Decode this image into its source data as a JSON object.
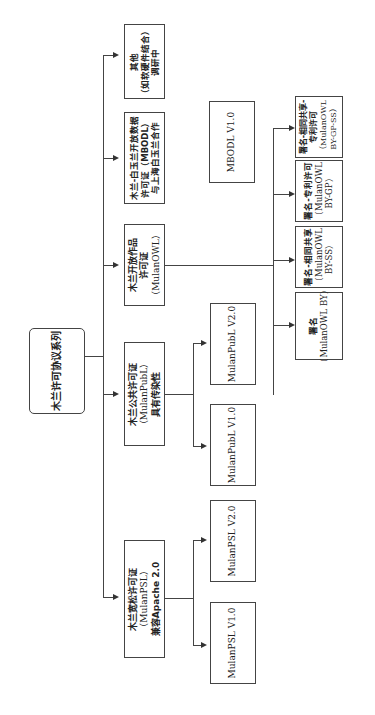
{
  "root": {
    "lines": [
      "木兰许可协议系列"
    ]
  },
  "level1": [
    {
      "id": "psl",
      "lines": [
        "木兰宽松许可证",
        "（MulanPSL）",
        "兼容Apache 2.0"
      ]
    },
    {
      "id": "publ",
      "lines": [
        "木兰公共许可证",
        "（MulanPubL）",
        "具有传染性"
      ]
    },
    {
      "id": "owl",
      "lines": [
        "木兰开放作品",
        "许可证",
        "（MulanOWL）"
      ]
    },
    {
      "id": "mbodl",
      "lines": [
        "木兰-白玉兰开放数据",
        "许可证（MBODL）",
        "与上海白玉兰合作"
      ]
    },
    {
      "id": "other",
      "lines": [
        "其他",
        "（如软硬件结合）",
        "调研中"
      ]
    }
  ],
  "leaves": {
    "psl": [
      {
        "lines": [
          "MulanPSL V1.0"
        ]
      },
      {
        "lines": [
          "MulanPSL V2.0"
        ]
      }
    ],
    "publ": [
      {
        "lines": [
          "MulanPubL V1.0"
        ]
      },
      {
        "lines": [
          "MulanPubL V2.0"
        ]
      }
    ],
    "mbodl": [
      {
        "lines": [
          "MBODL V1.0"
        ]
      }
    ],
    "owl": [
      {
        "lines": [
          "署名",
          "（MulanOWL BY）"
        ]
      },
      {
        "lines": [
          "署名-相同共享",
          "（MulanOWL",
          "BY-SS）"
        ]
      },
      {
        "lines": [
          "署名-专利许可",
          "（MulanOWL",
          "BY-GP）"
        ]
      },
      {
        "lines": [
          "署名-相同共享-",
          "专利许可",
          "（MulanOWL",
          "BY-GP-SS）"
        ]
      }
    ]
  }
}
